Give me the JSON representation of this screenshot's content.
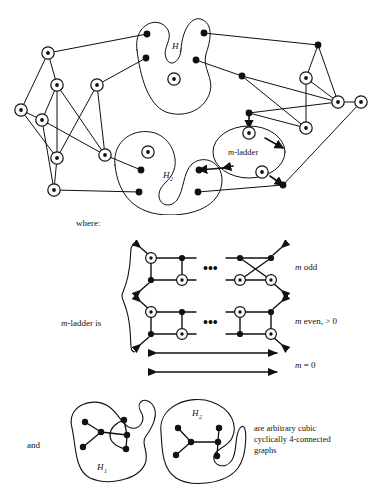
{
  "figure": {
    "title_visible": false,
    "type": "mathematical-graph-diagram",
    "colors": {
      "ink": "#111111",
      "background": "#ffffff",
      "node_fill": "#111111",
      "circle_node_fill": "#ffffff"
    }
  },
  "main_graph": {
    "name": "main-construction-graph",
    "blob_labels": {
      "h1": "H",
      "h1_sub": "1",
      "h2": "H",
      "h2_sub": "2"
    },
    "ladder_bubble_label": {
      "m": "m",
      "dash": "-",
      "word": "ladder"
    },
    "node_counts": {
      "circled": 17,
      "solid": 14
    }
  },
  "where_label": "where:",
  "ladder_definition": {
    "lhs": {
      "m": "m",
      "dash": "-",
      "text": "ladder is"
    },
    "ellipsis": "•••",
    "cases": [
      {
        "id": "m-odd",
        "label_m": "m",
        "label_rest": " odd"
      },
      {
        "id": "m-even",
        "label_m": "m",
        "label_rest": " even, > 0"
      },
      {
        "id": "m-zero",
        "label_m": "m",
        "label_rest": " = 0"
      }
    ]
  },
  "bottom": {
    "and_label": "and",
    "h1_label": "H",
    "h1_sub": "1",
    "h2_label": "H",
    "h2_sub": "2",
    "caption_lines": [
      "are arbitrary cubic",
      "cyclically 4-connected",
      "graphs"
    ]
  }
}
